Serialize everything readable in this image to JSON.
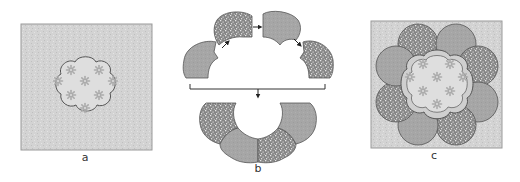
{
  "panels": [
    {
      "id": "a",
      "label": "a",
      "description": "Square background block with scalloped flower-shaped center appliqué"
    },
    {
      "id": "b",
      "label": "b",
      "description": "Scalloped petal pieces (alternating speckled and solid) being joined into a ring around the center"
    },
    {
      "id": "c",
      "label": "c",
      "description": "Finished block: ring of eight petals surrounding the scalloped center on square background"
    }
  ],
  "colors": {
    "background_fill": "#d3d3d3",
    "background_speck": "#c2c2c2",
    "outline": "#555555",
    "center_fill": "#dedede",
    "center_motif": "#ababab",
    "petal_solid": "#a6a6a6",
    "petal_speckled": "#858585",
    "petal_speck_light": "#e8e8e8",
    "arrow": "#222222"
  }
}
